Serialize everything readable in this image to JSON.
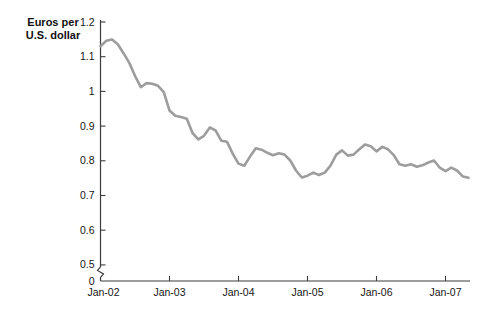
{
  "colors": {
    "background": "#ffffff",
    "line": "#9d9d9d",
    "axis": "#3c3c3c",
    "text": "#161616"
  },
  "chart_data": {
    "type": "line",
    "title": "",
    "ylabel": "Euros per U.S. dollar",
    "ylabel_line1": "Euros per",
    "ylabel_line2": "U.S. dollar",
    "xlabel": "",
    "grid": false,
    "legend": "none",
    "y_axis": {
      "ticks": [
        1.2,
        1.1,
        1.0,
        0.9,
        0.8,
        0.7,
        0.6,
        0.5
      ],
      "tick_labels": [
        "1.2",
        "1.1",
        "1",
        "0.9",
        "0.8",
        "0.7",
        "0.6",
        "0.5"
      ],
      "origin_label": "0",
      "broken_axis": true,
      "display_range": [
        0.5,
        1.2
      ]
    },
    "x_axis": {
      "tick_labels": [
        "Jan-02",
        "Jan-03",
        "Jan-04",
        "Jan-05",
        "Jan-06",
        "Jan-07"
      ],
      "tick_interval_months": 12
    },
    "series": [
      {
        "name": "Euros per U.S. dollar",
        "x_start": "Jan-02",
        "x_interval": "monthly",
        "values": [
          1.13,
          1.146,
          1.15,
          1.136,
          1.11,
          1.082,
          1.045,
          1.012,
          1.024,
          1.022,
          1.016,
          0.998,
          0.945,
          0.93,
          0.926,
          0.921,
          0.88,
          0.862,
          0.872,
          0.896,
          0.888,
          0.858,
          0.855,
          0.82,
          0.792,
          0.786,
          0.812,
          0.836,
          0.832,
          0.823,
          0.816,
          0.822,
          0.818,
          0.801,
          0.772,
          0.752,
          0.757,
          0.766,
          0.759,
          0.766,
          0.786,
          0.818,
          0.83,
          0.815,
          0.818,
          0.833,
          0.847,
          0.842,
          0.827,
          0.84,
          0.833,
          0.816,
          0.79,
          0.786,
          0.79,
          0.783,
          0.787,
          0.795,
          0.801,
          0.78,
          0.77,
          0.78,
          0.772,
          0.755,
          0.751
        ]
      }
    ]
  }
}
